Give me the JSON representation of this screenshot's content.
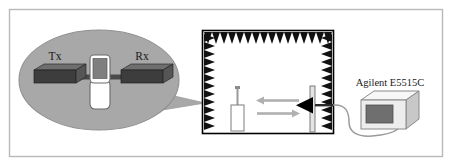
{
  "figure": {
    "frame_color": "#b9b9b9",
    "background": "#ffffff"
  },
  "callout": {
    "name": "magnifier-callout",
    "fill": "#a8a8a8",
    "stroke": "#8d8d8d",
    "labels": {
      "tx": "Tx",
      "rx": "Rx"
    },
    "devices": {
      "tx_block": "Tx antenna block",
      "rx_block": "Rx antenna block",
      "handset": "mobile-handset"
    },
    "colors": {
      "block_top": "#6e6e6e",
      "block_front": "#3d3d3d",
      "block_side": "#555555",
      "handset_body": "#ffffff",
      "handset_screen": "#7a7a7a",
      "handset_stroke": "#6a6a6a"
    }
  },
  "chamber": {
    "name": "anechoic-chamber",
    "wall_color": "#000000",
    "absorber_color": "#111111",
    "interior": "#ffffff",
    "top_teeth": 16,
    "left_teeth": 12,
    "right_teeth": 12,
    "dut": {
      "name": "dut-monopole-antenna",
      "stand_color": "#ffffff",
      "stand_stroke": "#7d7d7d",
      "mast_color": "#9a9a9a"
    },
    "horn": {
      "name": "horn-antenna",
      "color": "#000000",
      "pole_color": "#cccccc",
      "pole_stroke": "#6d6d6d"
    },
    "arrows": [
      {
        "name": "uplink-arrow",
        "direction": "left",
        "color": "#b0b0b0"
      },
      {
        "name": "downlink-arrow",
        "direction": "right",
        "color": "#b0b0b0"
      }
    ]
  },
  "instrument": {
    "name": "agilent-e5515c",
    "label": "Agilent E5515C",
    "colors": {
      "front": "#ededed",
      "top": "#f7f7f7",
      "side": "#c8c8c8",
      "screen": "#6f6f6f",
      "stroke": "#8a8a8a"
    }
  },
  "cable": {
    "name": "rf-cable",
    "color": "#9b9b9b"
  }
}
